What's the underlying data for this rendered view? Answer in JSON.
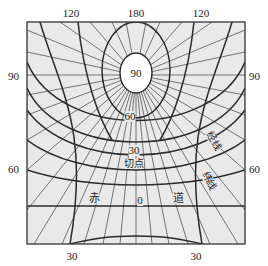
{
  "diagram": {
    "type": "oblique map projection graticule",
    "colors": {
      "background": "#e9e9e9",
      "frame": "#333333",
      "thick_line": "#2a2a2a",
      "thin_line": "#555555",
      "pole_fill": "#ffffff"
    },
    "top_labels": [
      "120",
      "180",
      "120"
    ],
    "side_labels": {
      "left_upper": "90",
      "right_upper": "90",
      "left_lower": "60",
      "right_lower": "60"
    },
    "bottom_labels": [
      "30",
      "30"
    ],
    "inner_labels": {
      "pole": "90",
      "lat60": "60",
      "lat30": "30",
      "tangent_point": "切点",
      "equator_left": "赤",
      "equator_value": "0",
      "equator_right": "道",
      "meridian": "经线",
      "parallel": "纬线"
    }
  }
}
